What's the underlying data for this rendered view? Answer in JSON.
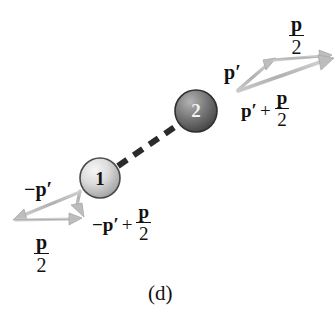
{
  "figure": {
    "caption": "(d)",
    "background_color": "#ffffff",
    "ink_color": "#111111",
    "vector_color": "#b8b8b8",
    "dash_color": "#2b2b2b"
  },
  "bodies": [
    {
      "id": "ball-1",
      "label": "1",
      "cx": 100,
      "cy": 178,
      "r": 20,
      "fill_light": "#efefef",
      "fill_dark": "#9a9a9a",
      "stroke": "#4a4a4a"
    },
    {
      "id": "ball-2",
      "label": "2",
      "cx": 196,
      "cy": 111,
      "r": 21,
      "fill_light": "#a9a9a9",
      "fill_dark": "#4e4e4e",
      "stroke": "#333333"
    }
  ],
  "trajectory": {
    "name": "collision-axis",
    "style": "dashed",
    "from_x": 118,
    "from_y": 166,
    "to_x": 178,
    "to_y": 124
  },
  "vectors": {
    "upper_right": {
      "origin_x": 237,
      "origin_y": 90,
      "p_prime": {
        "to_x": 274,
        "to_y": 61,
        "label": "p",
        "prime": true
      },
      "p_over_2": {
        "to_x": 331,
        "to_y": 56,
        "label_num": "p",
        "label_den": "2"
      },
      "resultant": {
        "to_x": 333,
        "to_y": 60,
        "label_lead": "p",
        "label_op": "+",
        "label_num": "p",
        "label_den": "2"
      }
    },
    "lower_left": {
      "origin_x": 82,
      "origin_y": 192,
      "minus_p_prime": {
        "to_x": 14,
        "to_y": 219,
        "label_sign": "−",
        "label": "p",
        "prime": true
      },
      "p_over_2": {
        "from_x": 16,
        "from_y": 220,
        "to_x": 81,
        "to_y": 218,
        "label_num": "p",
        "label_den": "2"
      },
      "resultant": {
        "to_x": 83,
        "to_y": 215,
        "label_sign": "−",
        "label_lead": "p",
        "label_op": "+",
        "label_num": "p",
        "label_den": "2"
      }
    }
  },
  "labels": {
    "top_p_over_2": {
      "num": "p",
      "den": "2",
      "x": 288,
      "y": 14
    },
    "p_prime_upper": {
      "text": "p",
      "prime": "′",
      "x": 226,
      "y": 63
    },
    "p_prime_plus_p_over_2": {
      "lead": "p",
      "prime": "′",
      "op": "+",
      "num": "p",
      "den": "2",
      "x": 241,
      "y": 90
    },
    "minus_p_prime_lower": {
      "sign": "−",
      "text": "p",
      "prime": "′",
      "x": 26,
      "y": 180
    },
    "bottom_p_over_2": {
      "num": "p",
      "den": "2",
      "x": 33,
      "y": 232
    },
    "minus_p_prime_plus_p_over_2": {
      "sign": "−",
      "lead": "p",
      "prime": "′",
      "op": "+",
      "num": "p",
      "den": "2",
      "x": 92,
      "y": 203
    }
  }
}
